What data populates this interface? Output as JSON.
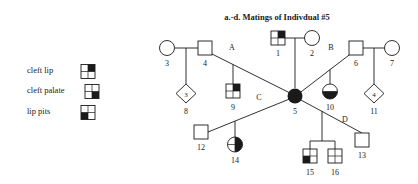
{
  "title": "a.-d. Matings of Indivdual #5",
  "legend": {
    "items": [
      {
        "label": "cleft lip",
        "symbol": "quad-square-upper-right-filled"
      },
      {
        "label": "cleft palate",
        "symbol": "quad-square-lower-right-filled"
      },
      {
        "label": "lip pits",
        "symbol": "quad-square-lower-left-filled"
      }
    ]
  },
  "mating_labels": [
    {
      "id": "A",
      "label": "A"
    },
    {
      "id": "B",
      "label": "B"
    },
    {
      "id": "C",
      "label": "C"
    },
    {
      "id": "D",
      "label": "D"
    }
  ],
  "individuals": [
    {
      "id": "1",
      "label": "1",
      "sex": "male",
      "shape": "square",
      "fill": "upper-right"
    },
    {
      "id": "2",
      "label": "2",
      "sex": "female",
      "shape": "circle",
      "fill": "none"
    },
    {
      "id": "3",
      "label": "3",
      "sex": "female",
      "shape": "circle",
      "fill": "none"
    },
    {
      "id": "4",
      "label": "4",
      "sex": "male",
      "shape": "square",
      "fill": "none"
    },
    {
      "id": "5",
      "label": "5",
      "sex": "female",
      "shape": "circle",
      "fill": "full"
    },
    {
      "id": "6",
      "label": "6",
      "sex": "male",
      "shape": "square",
      "fill": "none"
    },
    {
      "id": "7",
      "label": "7",
      "sex": "female",
      "shape": "circle",
      "fill": "none"
    },
    {
      "id": "8",
      "label": "8",
      "sex": "unknown",
      "shape": "diamond",
      "fill": "none",
      "count": "3"
    },
    {
      "id": "9",
      "label": "9",
      "sex": "male",
      "shape": "square",
      "fill": "upper-right"
    },
    {
      "id": "10",
      "label": "10",
      "sex": "female",
      "shape": "circle",
      "fill": "lower-half"
    },
    {
      "id": "11",
      "label": "11",
      "sex": "unknown",
      "shape": "diamond",
      "fill": "none",
      "count": "4"
    },
    {
      "id": "12",
      "label": "12",
      "sex": "male",
      "shape": "square",
      "fill": "none"
    },
    {
      "id": "13",
      "label": "13",
      "sex": "male",
      "shape": "square",
      "fill": "none"
    },
    {
      "id": "14",
      "label": "14",
      "sex": "female",
      "shape": "circle",
      "fill": "right-half"
    },
    {
      "id": "15",
      "label": "15",
      "sex": "male",
      "shape": "square",
      "fill": "lower-left"
    },
    {
      "id": "16",
      "label": "16",
      "sex": "male",
      "shape": "square",
      "fill": "none"
    }
  ],
  "colors": {
    "stroke": "#1a1a1a",
    "background": "#ffffff",
    "fill": "#1a1a1a"
  }
}
